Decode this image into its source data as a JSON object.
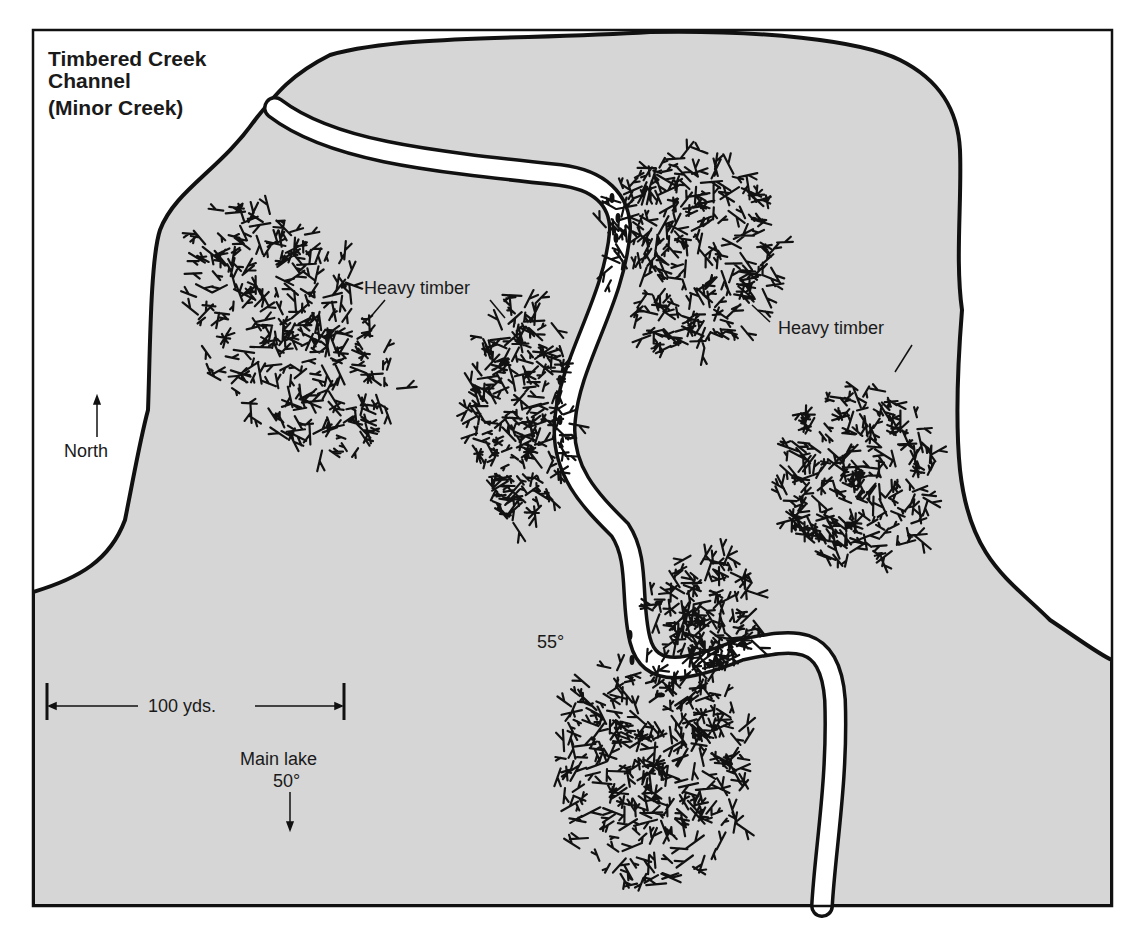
{
  "map": {
    "title_line1": "Timbered Creek",
    "title_line2": "Channel",
    "subtitle": "(Minor Creek)",
    "labels": {
      "north": "North",
      "heavy_timber_left": "Heavy timber",
      "heavy_timber_right": "Heavy timber",
      "channel_temp": "55°",
      "scale": "100 yds.",
      "main_lake": "Main lake",
      "main_lake_temp": "50°"
    },
    "icons": {
      "north_arrow": "arrow-up-icon",
      "lake_arrow": "arrow-down-icon"
    },
    "colors": {
      "land_water": "#d6d6d6",
      "shore_outline": "#111111",
      "creek": "#ffffff",
      "background": "#ffffff",
      "timber": "#111111"
    }
  }
}
